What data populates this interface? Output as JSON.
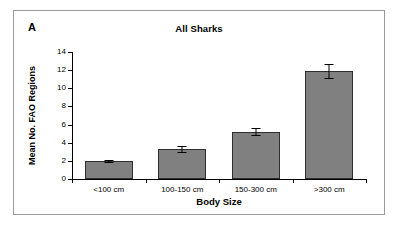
{
  "figure": {
    "panel_label": "A",
    "border_color": "#9a9a9a",
    "background": "#ffffff"
  },
  "chart_data": {
    "type": "bar",
    "title": "All Sharks",
    "xlabel": "Body Size",
    "ylabel": "Mean No. FAO Regions",
    "categories": [
      "<100 cm",
      "100-150 cm",
      "150-300 cm",
      ">300 cm"
    ],
    "values": [
      2.0,
      3.3,
      5.2,
      11.9
    ],
    "errors": [
      0.1,
      0.35,
      0.4,
      0.75
    ],
    "ylim": [
      0,
      14
    ],
    "ytick_labels": [
      "0",
      "2",
      "4",
      "6",
      "8",
      "10",
      "12",
      "14"
    ],
    "ytick_values": [
      0,
      2,
      4,
      6,
      8,
      10,
      12,
      14
    ],
    "grid": false,
    "legend": false,
    "bar_color": "#808080",
    "bar_edge_color": "#2e2e2e",
    "error_bar_color": "#000000",
    "axis_color": "#000000"
  }
}
